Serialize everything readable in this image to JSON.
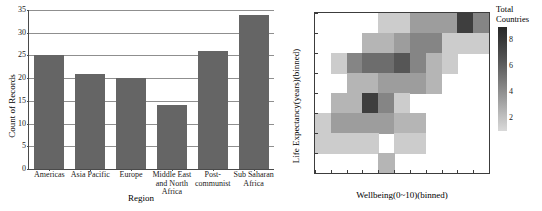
{
  "chart_data": [
    {
      "type": "bar",
      "title": "",
      "xlabel": "Region",
      "ylabel": "Count of Records",
      "categories": [
        "Americas",
        "Asia Pacific",
        "Europe",
        "Middle East and North Africa",
        "Post-communist",
        "Sub Saharan Africa"
      ],
      "category_lines": [
        [
          "Americas"
        ],
        [
          "Asia Pacific"
        ],
        [
          "Europe"
        ],
        [
          "Middle East",
          "and North",
          "Africa"
        ],
        [
          "Post-",
          "communist"
        ],
        [
          "Sub Saharan",
          "Africa"
        ]
      ],
      "values": [
        25,
        21,
        20,
        14,
        26,
        34
      ],
      "ylim": [
        0,
        35
      ],
      "yticks": [
        0,
        5,
        10,
        15,
        20,
        25,
        30,
        35
      ],
      "ytick_labels": [
        "0",
        "5",
        "10",
        "15",
        "20",
        "25",
        "30",
        "35"
      ],
      "grid": true,
      "legend": false,
      "bar_color": "#656565"
    },
    {
      "type": "heatmap",
      "title": "",
      "xlabel": "Wellbeing(0~10)(binned)",
      "ylabel": "Life Expectancy(years)(binned)",
      "xticks": [
        2.5,
        3.0,
        3.5,
        4.0,
        4.5,
        5.0,
        5.5,
        6.0,
        6.5,
        7.0,
        7.5,
        8.0
      ],
      "xtick_labels": [
        "2.5",
        "3.0",
        "3.5",
        "4.0",
        "4.5",
        "5.0",
        "5.5",
        "6.0",
        "6.5",
        "7.0",
        "7.5",
        "8.0"
      ],
      "yticks": [
        45,
        50,
        55,
        60,
        65,
        70,
        75,
        80,
        85
      ],
      "ytick_labels": [
        "45",
        "50",
        "55",
        "60",
        "65",
        "70",
        "75",
        "80",
        "85"
      ],
      "xlim": [
        2.5,
        8.0
      ],
      "ylim": [
        45,
        85
      ],
      "x_bin_width": 0.5,
      "y_bin_height": 5,
      "legend": {
        "title_lines": [
          "Total",
          "Countries"
        ],
        "title": "Total Countries",
        "ticks": [
          2,
          4,
          6,
          8
        ],
        "tick_labels": [
          "2",
          "4",
          "6",
          "8"
        ],
        "vmin": 1,
        "vmax": 9,
        "colormap": "greys-reversed",
        "position": "right"
      },
      "cells": [
        {
          "x": 4.5,
          "y": 80,
          "value": 2
        },
        {
          "x": 5.0,
          "y": 80,
          "value": 2
        },
        {
          "x": 5.5,
          "y": 80,
          "value": 4
        },
        {
          "x": 6.0,
          "y": 80,
          "value": 4
        },
        {
          "x": 6.5,
          "y": 80,
          "value": 4
        },
        {
          "x": 7.0,
          "y": 80,
          "value": 8
        },
        {
          "x": 7.5,
          "y": 80,
          "value": 5
        },
        {
          "x": 4.0,
          "y": 75,
          "value": 3
        },
        {
          "x": 4.5,
          "y": 75,
          "value": 3
        },
        {
          "x": 5.0,
          "y": 75,
          "value": 4
        },
        {
          "x": 5.5,
          "y": 75,
          "value": 5
        },
        {
          "x": 6.0,
          "y": 75,
          "value": 5
        },
        {
          "x": 6.5,
          "y": 75,
          "value": 2
        },
        {
          "x": 7.0,
          "y": 75,
          "value": 2
        },
        {
          "x": 7.5,
          "y": 75,
          "value": 2
        },
        {
          "x": 3.0,
          "y": 70,
          "value": 2
        },
        {
          "x": 3.5,
          "y": 70,
          "value": 5
        },
        {
          "x": 4.0,
          "y": 70,
          "value": 6
        },
        {
          "x": 4.5,
          "y": 70,
          "value": 6
        },
        {
          "x": 5.0,
          "y": 70,
          "value": 7
        },
        {
          "x": 5.5,
          "y": 70,
          "value": 5
        },
        {
          "x": 6.0,
          "y": 70,
          "value": 3
        },
        {
          "x": 6.5,
          "y": 70,
          "value": 2
        },
        {
          "x": 3.5,
          "y": 65,
          "value": 3
        },
        {
          "x": 4.0,
          "y": 65,
          "value": 3
        },
        {
          "x": 4.5,
          "y": 65,
          "value": 4
        },
        {
          "x": 5.0,
          "y": 65,
          "value": 4
        },
        {
          "x": 5.5,
          "y": 65,
          "value": 4
        },
        {
          "x": 6.0,
          "y": 65,
          "value": 3
        },
        {
          "x": 3.0,
          "y": 60,
          "value": 3
        },
        {
          "x": 3.5,
          "y": 60,
          "value": 3
        },
        {
          "x": 4.0,
          "y": 60,
          "value": 8
        },
        {
          "x": 4.5,
          "y": 60,
          "value": 5
        },
        {
          "x": 5.0,
          "y": 60,
          "value": 2
        },
        {
          "x": 2.5,
          "y": 55,
          "value": 2
        },
        {
          "x": 3.0,
          "y": 55,
          "value": 4
        },
        {
          "x": 3.5,
          "y": 55,
          "value": 4
        },
        {
          "x": 4.0,
          "y": 55,
          "value": 4
        },
        {
          "x": 4.5,
          "y": 55,
          "value": 4
        },
        {
          "x": 5.0,
          "y": 55,
          "value": 3
        },
        {
          "x": 5.5,
          "y": 55,
          "value": 3
        },
        {
          "x": 2.5,
          "y": 50,
          "value": 2
        },
        {
          "x": 3.0,
          "y": 50,
          "value": 2
        },
        {
          "x": 3.5,
          "y": 50,
          "value": 2
        },
        {
          "x": 4.0,
          "y": 50,
          "value": 2
        },
        {
          "x": 5.0,
          "y": 50,
          "value": 2
        },
        {
          "x": 5.5,
          "y": 50,
          "value": 2
        },
        {
          "x": 4.5,
          "y": 45,
          "value": 3
        }
      ]
    }
  ]
}
